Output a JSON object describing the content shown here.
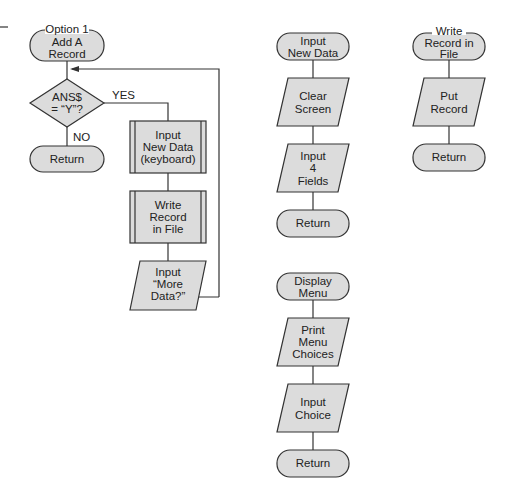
{
  "diagram": {
    "type": "flowchart",
    "fill_color": "#dcdcdc",
    "stroke_color": "#333333",
    "charts": [
      {
        "id": "option1",
        "nodes": [
          {
            "id": "o1_start",
            "shape": "terminal",
            "lines": [
              "Option 1",
              "Add A",
              "Record"
            ]
          },
          {
            "id": "o1_dec",
            "shape": "decision",
            "lines": [
              "ANS$",
              "= “Y”?"
            ]
          },
          {
            "id": "o1_ret",
            "shape": "terminal",
            "lines": [
              "Return"
            ]
          },
          {
            "id": "o1_input",
            "shape": "predefined-process",
            "lines": [
              "Input",
              "New Data",
              "(keyboard)"
            ]
          },
          {
            "id": "o1_write",
            "shape": "predefined-process",
            "lines": [
              "Write",
              "Record",
              "in File"
            ]
          },
          {
            "id": "o1_more",
            "shape": "io",
            "lines": [
              "Input",
              "“More",
              "Data?”"
            ]
          }
        ],
        "edge_labels": {
          "yes": "YES",
          "no": "NO"
        }
      },
      {
        "id": "input_new_data",
        "nodes": [
          {
            "id": "ind_start",
            "shape": "terminal",
            "lines": [
              "Input",
              "New Data"
            ]
          },
          {
            "id": "ind_clear",
            "shape": "io",
            "lines": [
              "Clear",
              "Screen"
            ]
          },
          {
            "id": "ind_fields",
            "shape": "io",
            "lines": [
              "Input",
              "4",
              "Fields"
            ]
          },
          {
            "id": "ind_ret",
            "shape": "terminal",
            "lines": [
              "Return"
            ]
          }
        ]
      },
      {
        "id": "write_record",
        "nodes": [
          {
            "id": "wr_start",
            "shape": "terminal",
            "lines": [
              "Write",
              "Record in",
              "File"
            ]
          },
          {
            "id": "wr_put",
            "shape": "io",
            "lines": [
              "Put",
              "Record"
            ]
          },
          {
            "id": "wr_ret",
            "shape": "terminal",
            "lines": [
              "Return"
            ]
          }
        ]
      },
      {
        "id": "display_menu",
        "nodes": [
          {
            "id": "dm_start",
            "shape": "terminal",
            "lines": [
              "Display",
              "Menu"
            ]
          },
          {
            "id": "dm_print",
            "shape": "io",
            "lines": [
              "Print",
              "Menu",
              "Choices"
            ]
          },
          {
            "id": "dm_input",
            "shape": "io",
            "lines": [
              "Input",
              "Choice"
            ]
          },
          {
            "id": "dm_ret",
            "shape": "terminal",
            "lines": [
              "Return"
            ]
          }
        ]
      }
    ]
  }
}
